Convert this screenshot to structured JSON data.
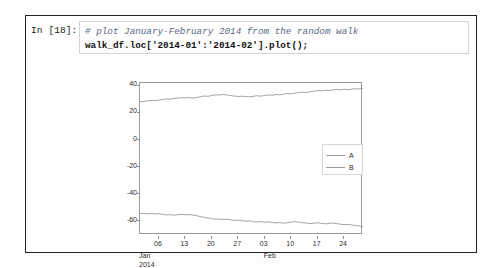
{
  "notebook": {
    "prompt": "In [18]:",
    "code": {
      "comment_line": "# plot January-February 2014 from the random walk",
      "code_line": "walk_df.loc['2014-01':'2014-02'].plot();"
    }
  },
  "chart_data": {
    "type": "line",
    "title": "",
    "xlabel": "",
    "ylabel": "",
    "ylim": [
      -70,
      42
    ],
    "xlim": [
      0,
      59
    ],
    "grid": false,
    "legend_position": "center-right",
    "yticks": [
      40,
      20,
      0,
      -20,
      -40,
      -60
    ],
    "ytick_labels": [
      "40",
      "20",
      "0",
      "-20",
      "-40",
      "-60"
    ],
    "xticks": [
      5,
      12,
      19,
      26,
      33,
      40,
      47,
      54
    ],
    "xtick_labels": [
      "06",
      "13",
      "20",
      "27",
      "03",
      "10",
      "17",
      "24"
    ],
    "minor_labels": [
      {
        "text_line1": "Jan",
        "text_line2": "2014",
        "x": 0
      },
      {
        "text_line1": "Feb",
        "text_line2": "",
        "x": 33
      }
    ],
    "colors": {
      "A": "#9a9a9a",
      "B": "#9a9a9a",
      "axis": "#9a9a9a",
      "text": "#2b2b2b"
    },
    "series": [
      {
        "name": "A",
        "values": [
          28.1,
          28.4,
          28.9,
          29.2,
          29.0,
          29.4,
          29.9,
          30.3,
          30.1,
          30.5,
          30.9,
          31.2,
          31.0,
          31.4,
          30.8,
          31.3,
          31.9,
          32.4,
          32.2,
          32.8,
          33.3,
          33.1,
          33.6,
          33.2,
          32.7,
          32.4,
          32.0,
          32.3,
          32.1,
          31.8,
          32.2,
          32.6,
          32.3,
          32.8,
          33.2,
          33.0,
          33.5,
          33.3,
          33.8,
          34.2,
          34.0,
          34.5,
          34.9,
          35.2,
          35.0,
          35.5,
          36.0,
          36.4,
          36.2,
          36.7,
          36.4,
          36.9,
          37.2,
          37.0,
          37.4,
          37.1,
          37.5,
          37.8,
          37.6,
          38.0
        ]
      },
      {
        "name": "B",
        "values": [
          -54.2,
          -54.0,
          -54.4,
          -54.1,
          -54.5,
          -54.3,
          -54.8,
          -55.2,
          -55.0,
          -55.4,
          -55.1,
          -54.8,
          -55.2,
          -54.9,
          -55.3,
          -55.8,
          -56.4,
          -57.0,
          -57.5,
          -58.0,
          -58.4,
          -58.2,
          -58.6,
          -58.3,
          -58.8,
          -59.2,
          -59.0,
          -59.5,
          -59.8,
          -59.6,
          -60.1,
          -60.4,
          -60.2,
          -60.6,
          -60.3,
          -60.8,
          -61.1,
          -60.9,
          -61.3,
          -61.0,
          -60.5,
          -60.2,
          -60.6,
          -60.9,
          -61.2,
          -61.6,
          -61.3,
          -61.0,
          -61.4,
          -61.8,
          -61.5,
          -61.2,
          -61.6,
          -62.0,
          -62.4,
          -62.2,
          -62.6,
          -63.0,
          -63.4,
          -63.8
        ]
      }
    ],
    "legend": [
      {
        "label": "A",
        "color": "#9a9a9a"
      },
      {
        "label": "B",
        "color": "#9a9a9a"
      }
    ]
  }
}
